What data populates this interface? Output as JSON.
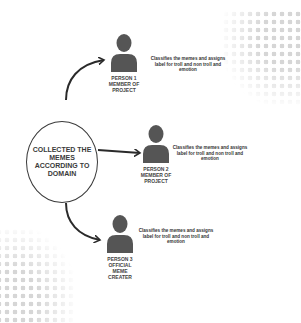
{
  "diagram": {
    "center_node": {
      "label": "COLLECTED THE MEMES ACCORDING TO DOMAIN"
    },
    "persons": [
      {
        "name": "PERSON 1\nMEMBER OF\nPROJECT",
        "description": "Classifies the memes and assigns label for troll and non troll and emotion",
        "icon": "person-icon"
      },
      {
        "name": "PERSON 2\nMEMBER OF\nPROJECT",
        "description": "Classifies the memes and assigns label for troll and non troll and emotion",
        "icon": "person-icon"
      },
      {
        "name": "PERSON 3\nOFFICIAL\nMEME CREATER",
        "description": "Classifies the memes and assigns label for troll and non troll and emotion",
        "icon": "person-icon"
      }
    ],
    "colors": {
      "icon": "#555555",
      "text": "#333333",
      "arrow": "#2a2a2a",
      "halftone": "#d6d6d6"
    }
  }
}
